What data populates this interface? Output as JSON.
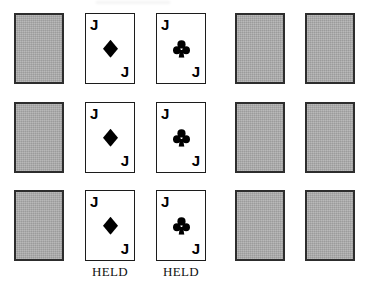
{
  "scene": {
    "title": "Video poker hand display",
    "rows": 3,
    "columns": 5,
    "background_color": "#ffffff",
    "card_back_color": "#a9a9a9",
    "card_border_color": "#2d2d2d",
    "face_border_color": "#1c1c1c",
    "pip_color": "#000000"
  },
  "cards": {
    "back_label": "",
    "jack_rank": "J",
    "diamond_name": "diamond-pip",
    "club_name": "club-pip"
  },
  "hands": [
    {
      "row_index": 0,
      "slots": [
        {
          "state": "face-down",
          "rank": "",
          "suit": ""
        },
        {
          "state": "face-up",
          "rank": "J",
          "suit": "diamonds"
        },
        {
          "state": "face-up",
          "rank": "J",
          "suit": "clubs"
        },
        {
          "state": "face-down",
          "rank": "",
          "suit": ""
        },
        {
          "state": "face-down",
          "rank": "",
          "suit": ""
        }
      ]
    },
    {
      "row_index": 1,
      "slots": [
        {
          "state": "face-down",
          "rank": "",
          "suit": ""
        },
        {
          "state": "face-up",
          "rank": "J",
          "suit": "diamonds"
        },
        {
          "state": "face-up",
          "rank": "J",
          "suit": "clubs"
        },
        {
          "state": "face-down",
          "rank": "",
          "suit": ""
        },
        {
          "state": "face-down",
          "rank": "",
          "suit": ""
        }
      ]
    },
    {
      "row_index": 2,
      "slots": [
        {
          "state": "face-down",
          "rank": "",
          "suit": ""
        },
        {
          "state": "face-up",
          "rank": "J",
          "suit": "diamonds"
        },
        {
          "state": "face-up",
          "rank": "J",
          "suit": "clubs"
        },
        {
          "state": "face-down",
          "rank": "",
          "suit": ""
        },
        {
          "state": "face-down",
          "rank": "",
          "suit": ""
        }
      ]
    }
  ],
  "held_labels": [
    {
      "column_index": 1,
      "text": "HELD"
    },
    {
      "column_index": 2,
      "text": "HELD"
    }
  ]
}
